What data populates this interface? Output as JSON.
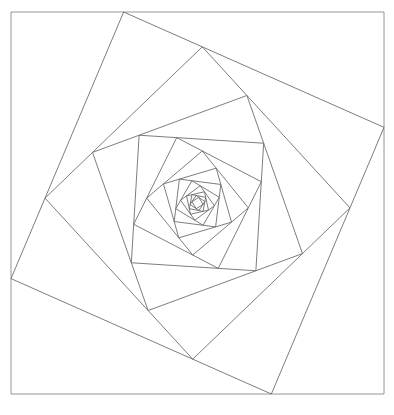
{
  "document": {
    "title": "Nested Rotating Squares Spiral",
    "kind": "geometric-line-drawing",
    "background_color": "#ffffff",
    "width": 394,
    "height": 415
  },
  "figure": {
    "name": "rotating-squares-vortex",
    "stroke_color": "#6e6e6e",
    "stroke_color_outer": "#8a8a8a",
    "stroke_width": 0.9,
    "outer_square": {
      "left": 11,
      "top": 12,
      "right": 384,
      "bottom": 394,
      "width": 373,
      "height": 382
    },
    "center": {
      "x": 197.5,
      "y": 203.0
    },
    "iterations": 15,
    "edge_fraction": 0.302,
    "rotation_per_step_deg": -16.85,
    "scale_per_step": 0.7241,
    "direction": "clockwise-inward",
    "vertex_samples": [
      {
        "label": "outer-top-left",
        "x": 11,
        "y": 12
      },
      {
        "label": "outer-top-right",
        "x": 384,
        "y": 12
      },
      {
        "label": "outer-bottom-right",
        "x": 384,
        "y": 394
      },
      {
        "label": "outer-bottom-left",
        "x": 11,
        "y": 394
      },
      {
        "label": "ring1-on-top-edge",
        "x": 124,
        "y": 12
      },
      {
        "label": "ring1-on-right-edge",
        "x": 384,
        "y": 127
      },
      {
        "label": "ring1-on-bottom-edge",
        "x": 272,
        "y": 394
      },
      {
        "label": "ring1-on-left-edge",
        "x": 11,
        "y": 279
      }
    ],
    "nested_axis_aligned_squares": [
      {
        "index": 0,
        "left": 11,
        "top": 12,
        "size": 373
      },
      {
        "index": 4,
        "left": 90,
        "top": 91,
        "size": 216
      },
      {
        "index": 8,
        "left": 133,
        "top": 136,
        "size": 126
      },
      {
        "index": 12,
        "left": 157,
        "top": 160,
        "size": 76
      }
    ]
  },
  "chart_data": {
    "type": "line",
    "xlabel": "",
    "ylabel": "",
    "series": [
      {
        "name": "square-0",
        "rotation_deg": 0.0,
        "half_size": 186.5
      },
      {
        "name": "square-1",
        "rotation_deg": -16.85,
        "half_size": 135.05
      },
      {
        "name": "square-2",
        "rotation_deg": -33.7,
        "half_size": 97.8
      },
      {
        "name": "square-3",
        "rotation_deg": -50.55,
        "half_size": 70.83
      },
      {
        "name": "square-4",
        "rotation_deg": -67.4,
        "half_size": 51.29
      },
      {
        "name": "square-5",
        "rotation_deg": -84.25,
        "half_size": 37.14
      },
      {
        "name": "square-6",
        "rotation_deg": -101.1,
        "half_size": 26.89
      },
      {
        "name": "square-7",
        "rotation_deg": -117.95,
        "half_size": 19.47
      },
      {
        "name": "square-8",
        "rotation_deg": -134.8,
        "half_size": 14.1
      },
      {
        "name": "square-9",
        "rotation_deg": -151.65,
        "half_size": 10.21
      },
      {
        "name": "square-10",
        "rotation_deg": -168.5,
        "half_size": 7.39
      },
      {
        "name": "square-11",
        "rotation_deg": -185.35,
        "half_size": 5.35
      },
      {
        "name": "square-12",
        "rotation_deg": -202.2,
        "half_size": 3.88
      },
      {
        "name": "square-13",
        "rotation_deg": -219.05,
        "half_size": 2.81
      },
      {
        "name": "square-14",
        "rotation_deg": -235.9,
        "half_size": 2.03
      }
    ]
  }
}
